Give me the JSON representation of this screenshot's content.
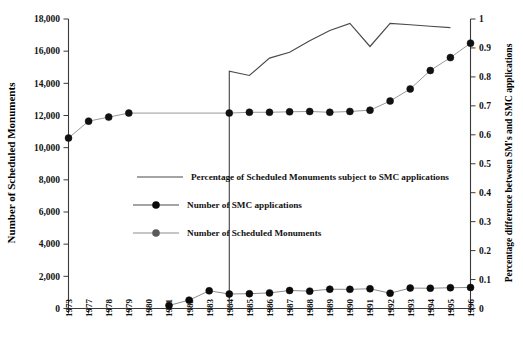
{
  "chart_data": {
    "type": "line",
    "title": "",
    "xlabel": "",
    "ylabel": "Number of Scheduled Monuments",
    "y2label": "Percentage difference between SM's and SMC applications",
    "grid": false,
    "legend_position": "center-left",
    "categories": [
      "1973",
      "1977",
      "1978",
      "1979",
      "1980",
      "1981",
      "1982",
      "1983",
      "1984",
      "1985",
      "1986",
      "1987",
      "1988",
      "1989",
      "1990",
      "1991",
      "1992",
      "1993",
      "1994",
      "1995",
      "1996"
    ],
    "yticks_left": [
      "0",
      "2,000",
      "4,000",
      "6,000",
      "8,000",
      "10,000",
      "12,000",
      "14,000",
      "16,000",
      "18,000"
    ],
    "yticks_left_values": [
      0,
      2000,
      4000,
      6000,
      8000,
      10000,
      12000,
      14000,
      16000,
      18000
    ],
    "ylim": [
      0,
      18000
    ],
    "yticks_right": [
      "0",
      "0.1",
      "0.2",
      "0.3",
      "0.4",
      "0.5",
      "0.6",
      "0.7",
      "0.8",
      "0.9",
      "1"
    ],
    "yticks_right_values": [
      0,
      0.1,
      0.2,
      0.3,
      0.4,
      0.5,
      0.6,
      0.7,
      0.8,
      0.9,
      1
    ],
    "y2lim": [
      0,
      1
    ],
    "series": [
      {
        "name": "Percentage of Scheduled Monuments subject to SMC applications",
        "axis": "right",
        "marker": "none",
        "color": "#4a4a4a",
        "x": [
          "1984",
          "1984",
          "1985",
          "1986",
          "1987",
          "1988",
          "1989",
          "1990",
          "1991",
          "1992",
          "1993",
          "1994",
          "1995"
        ],
        "values": [
          0.655,
          0.82,
          0.805,
          0.865,
          0.885,
          0.925,
          0.96,
          0.985,
          0.905,
          0.985,
          0.98,
          0.975,
          0.97
        ]
      },
      {
        "name": "Number of SMC applications",
        "axis": "left",
        "marker": "filled-circle-black",
        "color": "#0b0b0b",
        "x": [
          "1981",
          "1982",
          "1983",
          "1984",
          "1985",
          "1986",
          "1987",
          "1988",
          "1989",
          "1990",
          "1991",
          "1992",
          "1993",
          "1994",
          "1995",
          "1996"
        ],
        "values": [
          190,
          520,
          1100,
          900,
          920,
          970,
          1120,
          1080,
          1200,
          1190,
          1230,
          950,
          1270,
          1260,
          1290,
          1310
        ]
      },
      {
        "name": "Number of Scheduled Monuments",
        "axis": "left",
        "marker": "filled-circle-gray",
        "color": "#9a9a9a",
        "x": [
          "1973",
          "1977",
          "1978",
          "1979",
          "1984",
          "1985",
          "1986",
          "1987",
          "1988",
          "1989",
          "1990",
          "1991",
          "1992",
          "1993",
          "1994",
          "1995",
          "1996"
        ],
        "values": [
          10600,
          11650,
          11900,
          12150,
          12150,
          12200,
          12200,
          12230,
          12250,
          12200,
          12250,
          12330,
          12900,
          13650,
          14800,
          15600,
          16500
        ]
      }
    ]
  },
  "legend": {
    "items": [
      {
        "label": "Percentage of Scheduled Monuments subject to SMC applications",
        "style": "line-dark"
      },
      {
        "label": "Number of SMC applications",
        "style": "line-marker-black"
      },
      {
        "label": "Number of Scheduled Monuments",
        "style": "line-marker-gray"
      }
    ]
  },
  "axes": {
    "left_title": "Number of Scheduled Monuments",
    "right_title": "Percentage difference between SM's and SMC applications"
  },
  "colors": {
    "percentage_line": "#4a4a4a",
    "smc_marker": "#0b0b0b",
    "monuments_line": "#9a9a9a",
    "axis": "#3a3a3a",
    "background": "#ffffff"
  }
}
